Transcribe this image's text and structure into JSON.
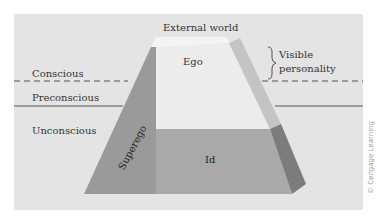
{
  "diagram": {
    "labels": {
      "external_world": "External world",
      "ego": "Ego",
      "superego": "Superego",
      "id": "Id",
      "visible_personality_line1": "Visible",
      "visible_personality_line2": "personality",
      "conscious": "Conscious",
      "preconscious": "Preconscious",
      "unconscious": "Unconscious"
    },
    "credit": "© Cengage Learning",
    "colors": {
      "background_panel": "#e4e4e4",
      "ego_face": "#ececec",
      "top_face": "#f4f4f4",
      "superego_face": "#9a9a9a",
      "id_face": "#a9a9a9",
      "right_face_upper": "#c4c4c4",
      "right_face_lower": "#7c7c7c",
      "lines": "#555555"
    }
  }
}
